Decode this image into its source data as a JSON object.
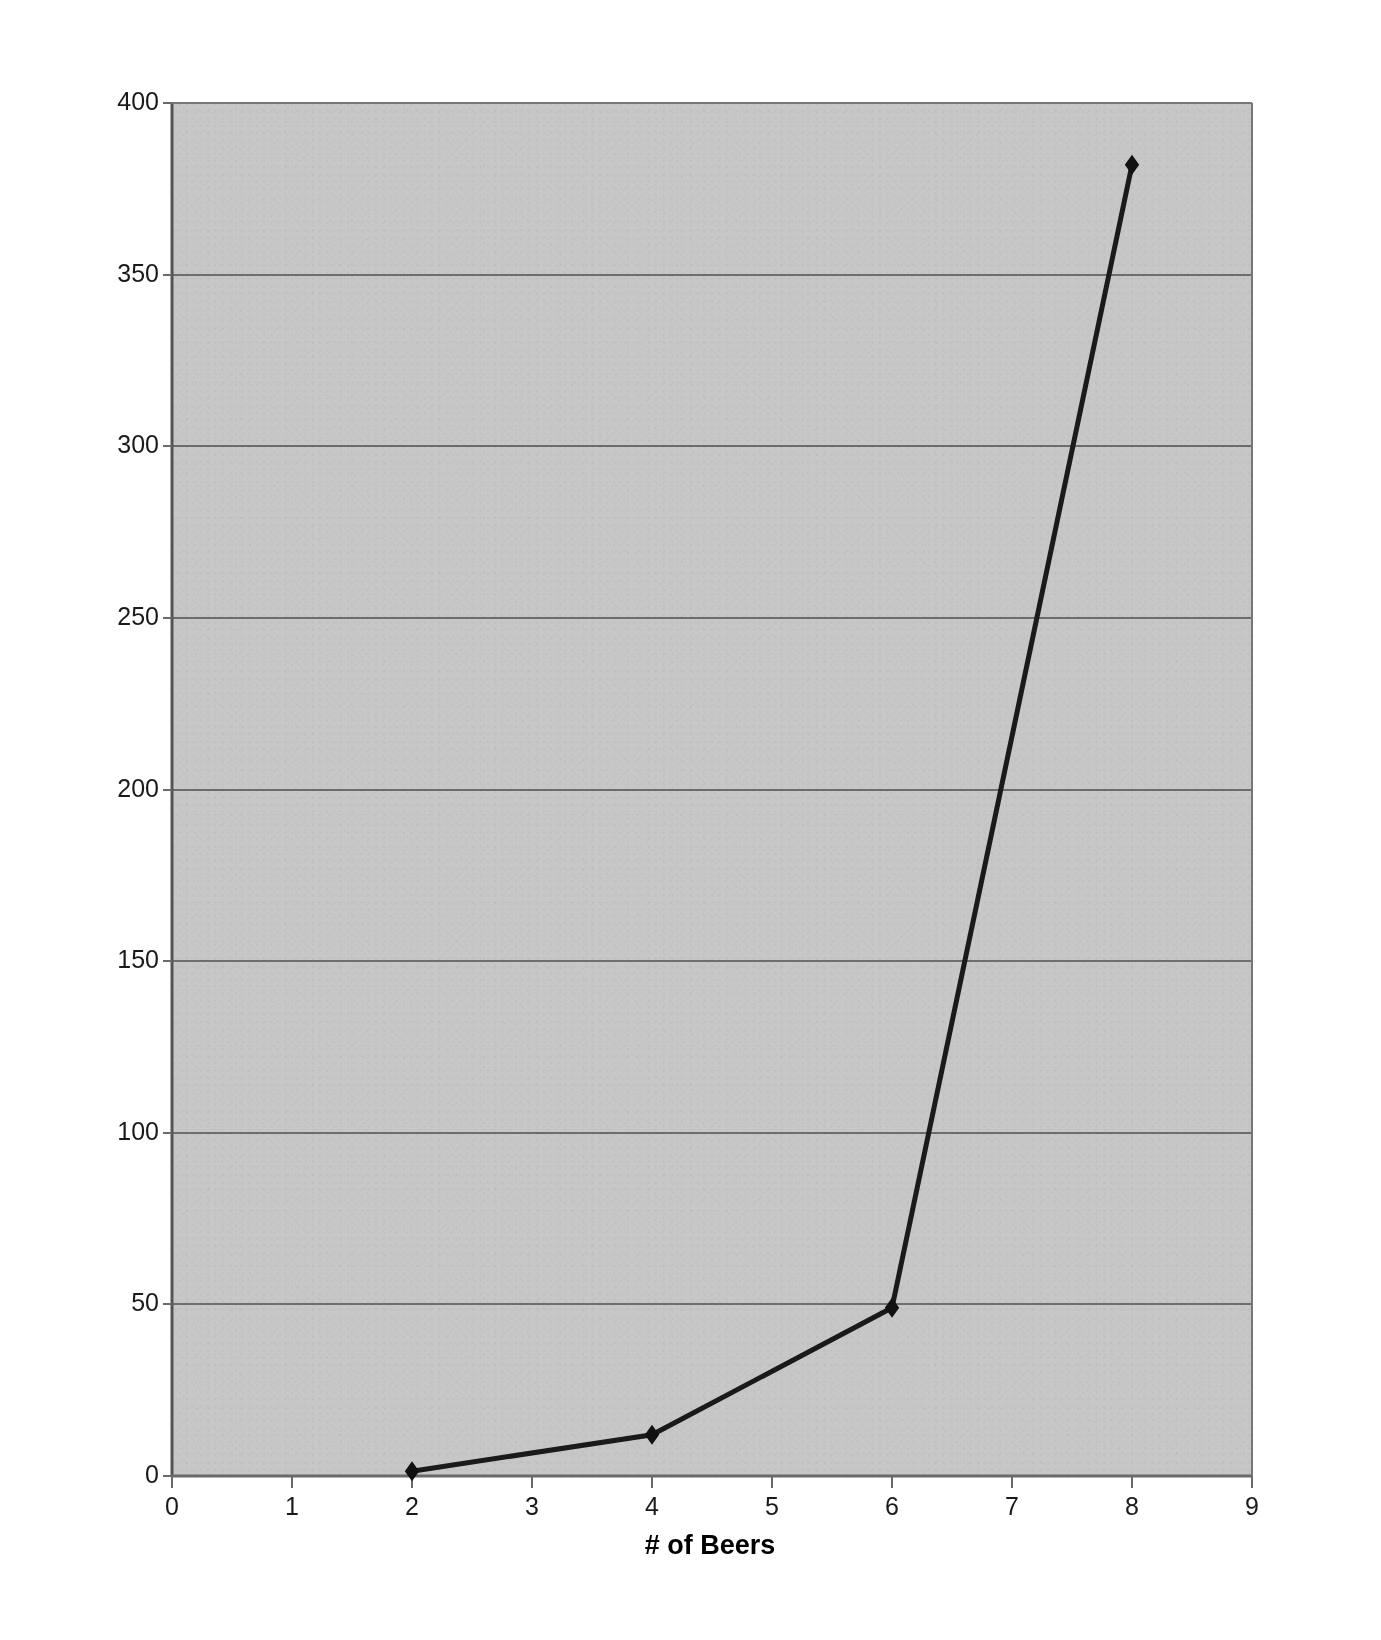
{
  "chart_data": {
    "type": "line",
    "title": "",
    "xlabel": "# of Beers",
    "ylabel": "Likelihood of accident (* times-fold increase)",
    "x": [
      2,
      4,
      6,
      8
    ],
    "values": [
      1.4,
      12,
      49,
      382
    ],
    "series": [
      {
        "name": "Likelihood of accident",
        "x": [
          2,
          4,
          6,
          8
        ],
        "values": [
          1.4,
          12,
          49,
          382
        ]
      }
    ],
    "xlim": [
      0,
      9
    ],
    "ylim": [
      0,
      400
    ],
    "xticks": [
      "0",
      "1",
      "2",
      "3",
      "4",
      "5",
      "6",
      "7",
      "8",
      "9"
    ],
    "yticks": [
      "0",
      "50",
      "100",
      "150",
      "200",
      "250",
      "300",
      "350",
      "400"
    ],
    "grid": "horizontal",
    "legend": "none",
    "marker": "diamond",
    "line_color": "#1a1a1a",
    "marker_color": "#111111",
    "plot_background": "#c7c7c7",
    "gridline_color": "#6e6e6e",
    "axis_color": "#5a5a5a",
    "figure_background": "#ffffff"
  }
}
